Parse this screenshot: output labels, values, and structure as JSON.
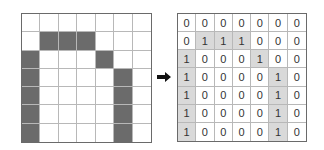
{
  "figure": {
    "arrow_icon": "right-arrow",
    "colors": {
      "filled_pixel": "#6b6b6b",
      "highlighted_cell": "#d9d9d9",
      "grid_line": "#b8b8b8",
      "border": "#6a6a6a"
    },
    "matrix": [
      [
        0,
        0,
        0,
        0,
        0,
        0,
        0
      ],
      [
        0,
        1,
        1,
        1,
        0,
        0,
        0
      ],
      [
        1,
        0,
        0,
        0,
        1,
        0,
        0
      ],
      [
        1,
        0,
        0,
        0,
        0,
        1,
        0
      ],
      [
        1,
        0,
        0,
        0,
        0,
        1,
        0
      ],
      [
        1,
        0,
        0,
        0,
        0,
        1,
        0
      ],
      [
        1,
        0,
        0,
        0,
        0,
        1,
        0
      ]
    ]
  }
}
